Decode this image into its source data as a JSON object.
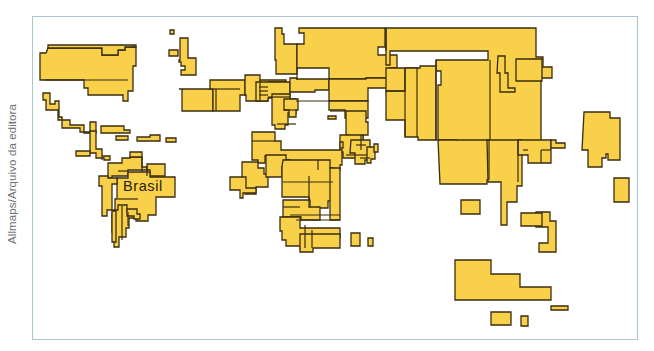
{
  "credit": "Allmaps/Arquivo da editora",
  "label": {
    "text": "Brasil",
    "x": 123,
    "y": 191
  },
  "colors": {
    "land": "#f8d04a",
    "border": "#3a2d10",
    "frame": "#a9c6d2",
    "credit_text": "#6f6f6f"
  },
  "map": {
    "type": "cartogram (anamorphic world map)",
    "shapes": [
      {
        "name": "usa-canada",
        "points": "46,53 48,48 102,48 102,55 118,55 118,50 125,50 125,47 136,47 136,66 133,66 133,91 128,91 128,101 123,101 123,95 88,95 88,88 84,88 84,80 40,80 40,53"
      },
      {
        "name": "canada-top",
        "points": "48,48 102,48 102,55 118,55 118,50 125,50 125,47 136,47 136,45 48,45"
      },
      {
        "name": "mexico",
        "points": "43,93 50,93 50,104 55,104 55,101 59,101 59,117 62,117 62,128 80,128 80,132 90,132 90,122 96,122 96,133 84,133 84,125 70,125 70,120 58,120 58,110 46,110 46,100 43,100"
      },
      {
        "name": "central-america",
        "points": "90,131 96,131 96,149 102,149 102,156 110,156 110,160 104,160 104,158 96,158 96,153 90,153"
      },
      {
        "name": "central-strip",
        "points": "76,151 90,151 90,156 76,156"
      },
      {
        "name": "cuba",
        "points": "101,126 124,126 124,130 130,130 130,133 101,133"
      },
      {
        "name": "hispaniola",
        "points": "116,136 128,136 128,140 116,140"
      },
      {
        "name": "caribbean-1",
        "points": "137,137 150,137 150,135 160,135 160,141 137,141"
      },
      {
        "name": "caribbean-2",
        "points": "166,138 176,138 176,142 166,142"
      },
      {
        "name": "colombia-venezuela",
        "points": "108,163 122,163 122,158 130,158 130,157 142,157 142,167 147,167 147,170 128,170 128,176 112,176 112,178 108,178"
      },
      {
        "name": "venezuela",
        "points": "130,152 142,152 142,157 130,157"
      },
      {
        "name": "guianas",
        "points": "147,164 165,164 165,176 150,176 150,170 147,170"
      },
      {
        "name": "brazil",
        "points": "117,178 128,178 128,172 150,172 150,177 175,177 175,197 156,197 156,215 148,215 148,221 136,221 136,212 115,212 115,199 117,199"
      },
      {
        "name": "peru-bolivia",
        "points": "99,176 108,176 108,178 117,178 117,184 112,184 112,210 107,210 107,216 102,216 102,186 99,186"
      },
      {
        "name": "argentina-chile",
        "points": "113,210 118,210 118,205 127,205 127,212 135,212 135,218 129,218 129,228 126,228 126,237 119,237 119,247 114,247 114,232 112,232 112,213"
      },
      {
        "name": "paraguay",
        "points": "127,209 137,209 137,214 140,214 140,219 134,219 134,216 127,216"
      },
      {
        "name": "chile-strip",
        "points": "112,211 116,211 116,242 112,242"
      },
      {
        "name": "iceland-small",
        "points": "170,30 174,30 174,34 170,34"
      },
      {
        "name": "uk-ireland",
        "points": "169,50 178,50 178,56 169,56"
      },
      {
        "name": "scandinavia",
        "points": "180,38 188,38 188,58 196,58 196,75 181,75 181,70 185,70 185,66 181,66 181,62 179,62 179,60 180,60"
      },
      {
        "name": "spain-france",
        "points": "179,89 213,89 213,111 182,111 182,89"
      },
      {
        "name": "france-germany",
        "points": "210,80 245,80 245,95 240,95 240,111 213,111 213,89 210,89"
      },
      {
        "name": "central-europe",
        "points": "245,75 260,75 260,80 286,80 286,82 268,82 268,101 246,101 246,95 245,95"
      },
      {
        "name": "russia-west",
        "points": "275,28 282,28 282,34 284,34 284,44 297,44 297,74 276,74 276,60 275,60"
      },
      {
        "name": "russia-main",
        "points": "299,28 385,28 385,47 378,47 378,55 397,55 397,68 390,68 390,78 366,78 366,79 329,79 329,68 297,68 297,44 304,44 304,33 299,33"
      },
      {
        "name": "russia-east",
        "points": "385,28 536,28 536,57 543,57 543,67 552,67 552,78 541,78 541,150 512,150 512,164 495,164 495,180 490,180 490,170 468,170 468,155 457,155 457,140 438,140 438,85 441,85 441,71 436,71 436,60 488,60 488,51 390,51 390,65 386,65 386,28"
      },
      {
        "name": "eastern-europe",
        "points": "256,82 290,82 290,98 268,98 268,101 256,101"
      },
      {
        "name": "ukraine",
        "points": "290,78 297,78 297,79 329,79 329,90 315,90 315,92 290,92"
      },
      {
        "name": "kazakh",
        "points": "329,79 366,79 366,78 390,78 390,88 368,88 368,101 329,101"
      },
      {
        "name": "china",
        "points": "386,68 417,68 417,72 420,72 420,113 410,113 410,118 395,118 395,92 386,92"
      },
      {
        "name": "china-east",
        "points": "405,68 420,68 420,66 436,66 436,140 418,140 418,137 405,137 405,120 386,120 386,91 405,91"
      },
      {
        "name": "balkans",
        "points": "272,94 290,94 290,99 296,99 296,113 288,113 288,125 285,125 285,129 275,129 275,125 272,125"
      },
      {
        "name": "turkey-caucasus",
        "points": "284,99 298,99 298,110 296,110 296,117 289,117 289,110 284,110"
      },
      {
        "name": "central-asia",
        "points": "329,101 368,101 368,118 345,118 345,110 329,110"
      },
      {
        "name": "iran-pak",
        "points": "346,111 366,111 366,122 368,122 368,135 363,135 363,140 349,140 349,135 346,135"
      },
      {
        "name": "caspian-small",
        "points": "328,116 336,116 336,119 328,119"
      },
      {
        "name": "middle-east",
        "points": "340,135 363,135 363,141 367,141 367,152 356,152 356,158 343,158 343,152 340,152"
      },
      {
        "name": "arabia",
        "points": "340,142 343,142 343,148 340,148"
      },
      {
        "name": "india",
        "points": "351,140 370,140 370,160 365,160 365,164 355,164 355,153 350,153"
      },
      {
        "name": "southeast-asia",
        "points": "367,147 375,147 375,159 371,159 371,163 367,163"
      },
      {
        "name": "sri-lanka",
        "points": "374,144 378,144 378,152 374,152"
      },
      {
        "name": "north-africa",
        "points": "252,132 275,132 275,141 281,141 281,150 342,150 342,165 340,165 340,170 320,170 320,180 310,180 310,167 290,167 290,160 281,160 281,163 276,163 276,156 265,156 265,163 258,163 258,160 252,160"
      },
      {
        "name": "west-africa",
        "points": "242,162 258,162 258,168 264,168 264,174 268,174 268,187 256,187 256,194 245,194 245,182 242,182"
      },
      {
        "name": "sahel",
        "points": "266,155 286,155 286,160 290,160 290,167 282,167 282,177 266,177"
      },
      {
        "name": "west-africa-2",
        "points": "230,177 246,177 246,188 256,188 256,193 243,193 243,198 240,198 240,190 230,190"
      },
      {
        "name": "egypt-sudan",
        "points": "283,160 330,160 330,168 333,168 333,201 328,201 328,208 309,208 309,197 282,197 282,167"
      },
      {
        "name": "east-africa",
        "points": "330,168 340,168 340,220 330,220"
      },
      {
        "name": "central-africa",
        "points": "283,200 310,200 310,207 320,207 320,220 301,220 301,217 283,217"
      },
      {
        "name": "southern-africa",
        "points": "280,217 300,217 300,228 340,228 340,238 312,238 312,249 300,249 300,248 301,248 301,246 286,246 286,240 282,240 282,231 280,231"
      },
      {
        "name": "south-africa",
        "points": "300,234 340,234 340,248 313,248 313,252 300,252"
      },
      {
        "name": "madagascar-1",
        "points": "351,233 360,233 360,246 351,246"
      },
      {
        "name": "madagascar-2",
        "points": "368,238 373,238 373,246 368,246"
      },
      {
        "name": "korea-japan",
        "points": "498,56 505,56 505,73 508,73 508,88 515,88 515,92 500,92 500,73 497,73"
      },
      {
        "name": "japan",
        "points": "516,59 542,59 542,81 516,81"
      },
      {
        "name": "japan-islands",
        "points": "584,112 610,112 610,118 620,118 620,160 608,160 608,154 606,154 606,158 602,158 602,167 588,167 588,150 582,150"
      },
      {
        "name": "southeast-mainland",
        "points": "438,140 489,140 489,180 487,180 487,184 440,184"
      },
      {
        "name": "indochina",
        "points": "487,140 522,140 522,186 517,186 517,202 507,202 507,225 501,225 501,182 488,182"
      },
      {
        "name": "philippines",
        "points": "518,140 551,140 551,163 528,163 528,155 518,155"
      },
      {
        "name": "taiwan",
        "points": "551,140 556,140 556,143 565,143 565,148 551,148"
      },
      {
        "name": "indonesia-small",
        "points": "461,200 480,200 480,214 461,214"
      },
      {
        "name": "borneo",
        "points": "536,212 550,212 550,221 556,221 556,252 539,252 539,243 548,243 548,227 536,227"
      },
      {
        "name": "malaysia",
        "points": "521,213 542,213 542,226 521,226"
      },
      {
        "name": "pacific-islands",
        "points": "614,178 629,178 629,202 614,202"
      },
      {
        "name": "australia",
        "points": "455,260 491,260 491,274 520,274 520,287 551,287 551,300 455,300"
      },
      {
        "name": "new-guinea",
        "points": "551,306 568,306 568,310 551,310"
      },
      {
        "name": "nz-1",
        "points": "491,312 511,312 511,325 491,325"
      },
      {
        "name": "nz-2",
        "points": "521,316 528,316 528,326 521,326"
      }
    ],
    "internal_lines": [
      "M133,45 L133,47",
      "M45,80 L128,80",
      "M102,157 L102,160",
      "M118,171 L128,171",
      "M216,89 L216,111",
      "M213,89 L240,89",
      "M260,80 L260,101",
      "M259,87 L268,87",
      "M259,91 L268,91",
      "M259,95 L268,95",
      "M297,68 L297,80",
      "M386,28 L386,51",
      "M436,60 L436,141",
      "M417,68 L417,137",
      "M490,60 L490,140",
      "M386,91 L405,91",
      "M405,68 L405,137",
      "M268,97 L290,97",
      "M296,101 L329,101",
      "M330,111 L346,111",
      "M252,141 L275,141",
      "M318,160 L318,170",
      "M283,182 L333,182",
      "M309,176 L309,208",
      "M283,207 L300,207",
      "M290,215 L340,215",
      "M296,220 L340,220",
      "M305,225 L305,248",
      "M312,230 L312,248",
      "M489,140 L489,180",
      "M518,140 L518,182",
      "M523,150 L528,150",
      "M541,150 L551,150",
      "M541,150 L541,163",
      "M118,199 L138,199",
      "M122,206 L122,240",
      "M128,212 L128,226",
      "M142,157 L142,172",
      "M147,166 L147,176",
      "M284,110 L296,110",
      "M277,124 L296,124",
      "M356,145 L366,145",
      "M361,135 L361,150",
      "M346,155 L367,155",
      "M360,158 L370,158"
    ]
  }
}
